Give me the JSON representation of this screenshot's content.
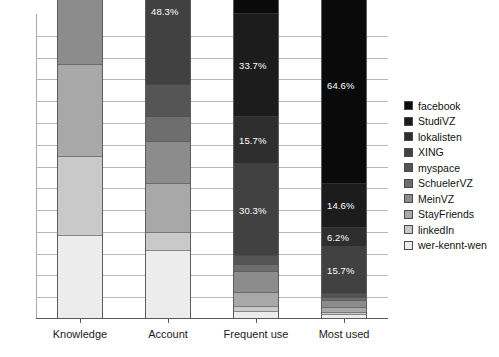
{
  "chart_data": {
    "type": "bar",
    "subtype": "stacked-bar",
    "title": "",
    "subtitle": "",
    "xlabel": "",
    "ylabel": "",
    "ylim": [
      0,
      100
    ],
    "grid": true,
    "gridline_count": 13,
    "legend_position": "right",
    "categories": [
      "Knowledge",
      "Account",
      "Frequent use",
      "Most used"
    ],
    "series": [
      {
        "name": "facebook",
        "color": "#0a0a0a",
        "values": [
          98.9,
          79.8,
          73.0,
          64.6
        ],
        "labels": [
          "98.9%",
          "79.8%",
          "73.0%",
          "64.6%"
        ]
      },
      {
        "name": "StudiVZ",
        "color": "#1c1c1c",
        "values": [
          95.5,
          62.9,
          33.7,
          14.6
        ],
        "labels": [
          "95.5%",
          "62.9%",
          "33.7%",
          "14.6%"
        ]
      },
      {
        "name": "lokalisten",
        "color": "#2e2e2e",
        "values": [
          91.0,
          41.6,
          15.7,
          6.2
        ],
        "labels": [
          "91.0%",
          "41.6%",
          "15.7%",
          "6.2%"
        ]
      },
      {
        "name": "XING",
        "color": "#414141",
        "values": [
          85.4,
          48.3,
          30.3,
          15.7
        ],
        "labels": [
          "85.4%",
          "48.3%",
          "30.3%",
          "15.7%"
        ]
      },
      {
        "name": "myspace",
        "color": "#555555",
        "values": [
          70.0,
          10.5,
          3.0,
          1.2
        ],
        "labels": [
          "",
          "",
          "",
          ""
        ]
      },
      {
        "name": "SchuelerVZ",
        "color": "#6e6e6e",
        "values": [
          62.0,
          8.0,
          2.2,
          0.9
        ],
        "labels": [
          "",
          "",
          "",
          ""
        ]
      },
      {
        "name": "MeinVZ",
        "color": "#8c8c8c",
        "values": [
          55.0,
          14.0,
          7.0,
          2.4
        ],
        "labels": [
          "",
          "",
          "",
          ""
        ]
      },
      {
        "name": "StayFriends",
        "color": "#a8a8a8",
        "values": [
          30.0,
          16.0,
          4.5,
          1.5
        ],
        "labels": [
          "",
          "",
          "",
          ""
        ]
      },
      {
        "name": "linkedIn",
        "color": "#c9c9c9",
        "values": [
          26.0,
          6.0,
          1.6,
          0.8
        ],
        "labels": [
          "",
          "",
          "",
          ""
        ]
      },
      {
        "name": "wer-kennt-wen",
        "color": "#ececec",
        "values": [
          27.0,
          22.0,
          2.0,
          1.0
        ],
        "labels": [
          "",
          "",
          "",
          ""
        ]
      }
    ]
  },
  "legend": {
    "items": [
      {
        "label": "facebook",
        "color": "#0a0a0a"
      },
      {
        "label": "StudiVZ",
        "color": "#1c1c1c"
      },
      {
        "label": "lokalisten",
        "color": "#2e2e2e"
      },
      {
        "label": "XING",
        "color": "#414141"
      },
      {
        "label": "myspace",
        "color": "#555555"
      },
      {
        "label": "SchuelerVZ",
        "color": "#6e6e6e"
      },
      {
        "label": "MeinVZ",
        "color": "#8c8c8c"
      },
      {
        "label": "StayFriends",
        "color": "#a8a8a8"
      },
      {
        "label": "linkedIn",
        "color": "#c9c9c9"
      },
      {
        "label": "wer-kennt-wen",
        "color": "#ececec"
      }
    ]
  },
  "axis": {
    "categories": [
      "Knowledge",
      "Account",
      "Frequent use",
      "Most used"
    ]
  },
  "style": {
    "gridline_color": "#b9b9b9",
    "axis_color": "#5a5a5a",
    "bar_border_color": "#5d5d5d",
    "label_text_color": "#ffffff",
    "background": "#ffffff"
  }
}
